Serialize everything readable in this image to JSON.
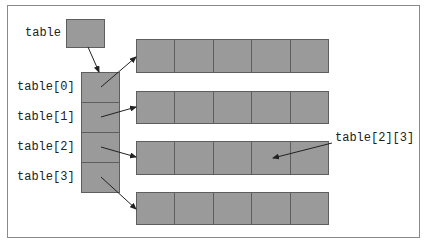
{
  "diagram": {
    "labels": {
      "table": "table",
      "row_refs": [
        "table[0]",
        "table[1]",
        "table[2]",
        "table[3]"
      ],
      "element_ref": "table[2][3]"
    },
    "rows": 4,
    "columns": 5,
    "colors": {
      "cell_fill": "#9a9a9a",
      "cell_border": "#5e5e5e",
      "arrow": "#222222",
      "frame_border": "#8a8a8a"
    }
  }
}
